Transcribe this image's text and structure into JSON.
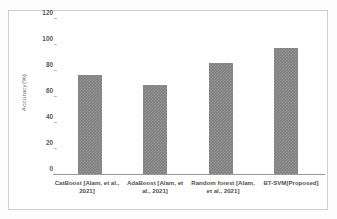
{
  "chart_data": {
    "type": "bar",
    "title": "",
    "xlabel": "",
    "ylabel": "Accuracy(%)",
    "categories": [
      "CatBoost [Alam, et al., 2021]",
      "AdaBoost [Alam, et al., 2021]",
      "Random forest [Alam, et al., 2021]",
      "BT-SVM[Proposed]"
    ],
    "values": [
      77,
      69,
      86,
      98
    ],
    "ylim": [
      0,
      120
    ],
    "yticks": [
      0,
      20,
      40,
      60,
      80,
      100,
      120
    ],
    "ytick_labels": [
      "0",
      "20",
      "40",
      "60",
      "80",
      "100",
      "120"
    ],
    "grid": false,
    "legend": "none",
    "bar_color": "#7f7f7f",
    "axis_color": "#9a9a9a",
    "frame_color": "#cfcfcf"
  }
}
